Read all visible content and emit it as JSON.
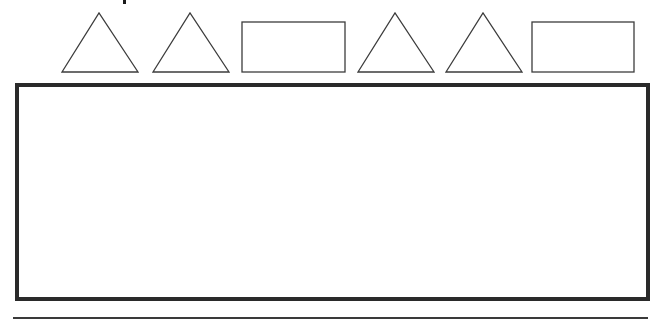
{
  "worksheet": {
    "type": "shape-pattern",
    "stroke_color": "#3c3c3c",
    "box_border_color": "#2a2a2a",
    "line_color": "#3a3a3a",
    "pattern": [
      {
        "shape": "triangle"
      },
      {
        "shape": "triangle"
      },
      {
        "shape": "rectangle"
      },
      {
        "shape": "triangle"
      },
      {
        "shape": "triangle"
      },
      {
        "shape": "rectangle"
      }
    ],
    "answer_box": {
      "content": ""
    },
    "writing_line": {
      "content": ""
    }
  }
}
